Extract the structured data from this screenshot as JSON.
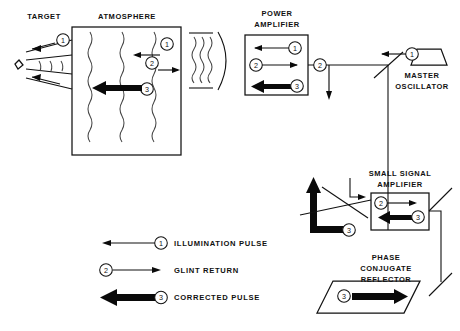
{
  "diagram": {
    "title_labels": {
      "target": "TARGET",
      "atmosphere": "ATMOSPHERE",
      "power_amplifier_line1": "POWER",
      "power_amplifier_line2": "AMPLIFIER",
      "master_oscillator_line1": "MASTER",
      "master_oscillator_line2": "OSCILLATOR",
      "small_signal_amplifier_line1": "SMALL SIGNAL",
      "small_signal_amplifier_line2": "AMPLIFIER",
      "phase_conjugate_reflector_line1": "PHASE",
      "phase_conjugate_reflector_line2": "CONJUGATE",
      "phase_conjugate_reflector_line3": "REFLECTOR"
    },
    "markers": {
      "one": "1",
      "two": "2",
      "three": "3"
    },
    "legend": {
      "items": [
        {
          "marker": "1",
          "label": "ILLUMINATION PULSE",
          "style": "thin-left"
        },
        {
          "marker": "2",
          "label": "GLINT RETURN",
          "style": "thin-right"
        },
        {
          "marker": "3",
          "label": "CORRECTED PULSE",
          "style": "thick-left"
        }
      ]
    },
    "colors": {
      "stroke": "#111111",
      "background": "#ffffff",
      "thick_arrow": "#0a0a0a",
      "wave": "#444444"
    }
  }
}
